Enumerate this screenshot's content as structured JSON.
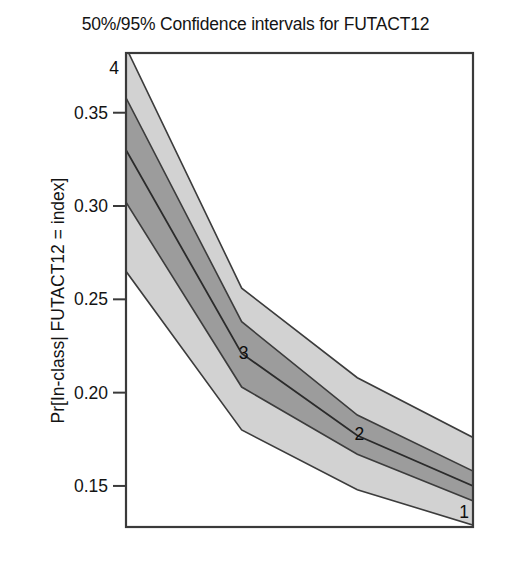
{
  "chart_data": {
    "type": "area",
    "title": "50%/95% Confidence intervals for FUTACT12",
    "xlabel": "Index",
    "ylabel": "Pr[In-class| FUTACT12 = index]",
    "x": [
      1,
      2,
      3,
      4
    ],
    "x_display_order": [
      4,
      3,
      2,
      1
    ],
    "xlim": [
      4,
      1
    ],
    "ylim": [
      0.128,
      0.382
    ],
    "yticks": [
      0.15,
      0.2,
      0.25,
      0.3,
      0.35
    ],
    "ytick_labels": [
      "0.15",
      "0.20",
      "0.25",
      "0.30",
      "0.35"
    ],
    "xticks": [],
    "grid": false,
    "legend": false,
    "point_labels": [
      {
        "label": "4",
        "x": 4,
        "y": 0.378
      },
      {
        "label": "3",
        "x": 3,
        "y": 0.221
      },
      {
        "label": "2",
        "x": 2,
        "y": 0.178
      },
      {
        "label": "1",
        "x": 1,
        "y": 0.148
      }
    ],
    "series": [
      {
        "name": "point estimate",
        "values": [
          0.15,
          0.177,
          0.221,
          0.33
        ]
      },
      {
        "name": "50% CI lower",
        "values": [
          0.142,
          0.167,
          0.203,
          0.302
        ]
      },
      {
        "name": "50% CI upper",
        "values": [
          0.158,
          0.188,
          0.238,
          0.358
        ]
      },
      {
        "name": "95% CI lower",
        "values": [
          0.129,
          0.148,
          0.18,
          0.265
        ]
      },
      {
        "name": "95% CI upper",
        "values": [
          0.176,
          0.208,
          0.256,
          0.385
        ]
      }
    ],
    "colors": {
      "band_95": "#d2d2d2",
      "band_50": "#9c9c9c",
      "line": "#2b2b2b",
      "frame": "#3a3a3a",
      "text": "#141414",
      "background": "#ffffff"
    }
  }
}
